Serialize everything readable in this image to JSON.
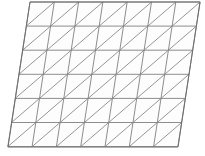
{
  "figure": {
    "type": "geometric-diagram"
  },
  "canvas": {
    "width": 205,
    "height": 156,
    "background_color": "#ffffff"
  },
  "mesh": {
    "columns": 7,
    "rows": 6,
    "cell_width": 24.3,
    "row_height": 24.1,
    "shear_per_row": -3.7,
    "diagonal_direction": "bottom-left-to-top-right",
    "origin_x": 30.0,
    "origin_y": 2.0,
    "line_color": "#808080",
    "diagonal_color": "#8a8a8a",
    "border_color": "#6e6e6e",
    "cell_fill_color": "#fdfdfd",
    "line_width": 0.9,
    "border_width": 1.0
  },
  "corners": {
    "top_left": [
      30,
      2
    ],
    "top_right": [
      200,
      2
    ],
    "bottom_right": [
      178,
      147
    ],
    "bottom_left": [
      8,
      147
    ]
  }
}
